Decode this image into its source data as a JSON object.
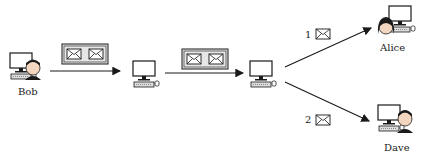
{
  "nodes": {
    "sender": {
      "label": "Bob"
    },
    "relay1": {
      "label": ""
    },
    "relay2": {
      "label": ""
    },
    "recipient1": {
      "label": "Alice"
    },
    "recipient2": {
      "label": "Dave"
    }
  },
  "edges": {
    "bob_to_relay1": {
      "envelopes": 2
    },
    "relay1_to_relay2": {
      "envelopes": 2
    },
    "relay2_to_alice": {
      "number": "1",
      "envelopes": 1
    },
    "relay2_to_dave": {
      "number": "2",
      "envelopes": 1
    }
  },
  "colors": {
    "stroke": "#1a1a1a",
    "box_fill": "#e6e6e6",
    "envelope_fill": "#ffffff"
  }
}
